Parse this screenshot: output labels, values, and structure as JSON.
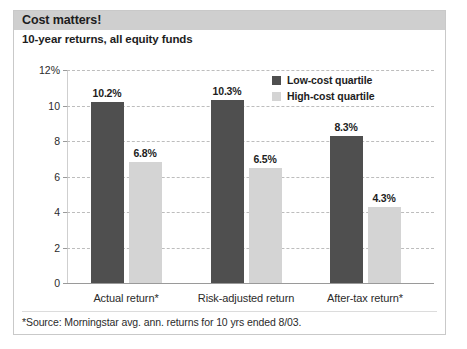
{
  "header": {
    "title": "Cost matters!",
    "subtitle": "10-year returns, all equity funds"
  },
  "footnote": "*Source: Morningstar avg. ann. returns for 10 yrs ended 8/03.",
  "legend": {
    "position": "top-right",
    "items": [
      {
        "label": "Low-cost quartile",
        "color": "#4f4f4f"
      },
      {
        "label": "High-cost quartile",
        "color": "#d4d4d4"
      }
    ]
  },
  "colors": {
    "low_cost": "#4f4f4f",
    "high_cost": "#d4d4d4",
    "header_band": "#cfcfcf",
    "gridline": "#bdbdbd",
    "frame": "#c9c9c9"
  },
  "chart_data": {
    "type": "bar",
    "title": "Cost matters!",
    "subtitle": "10-year returns, all equity funds",
    "xlabel": "",
    "ylabel": "",
    "ylim": [
      0,
      12
    ],
    "grid": true,
    "legend_position": "top-right",
    "categories": [
      "Actual return*",
      "Risk-adjusted return",
      "After-tax return*"
    ],
    "yticks": [
      0,
      2,
      4,
      6,
      8,
      10,
      12
    ],
    "ytick_labels": [
      "0",
      "2",
      "4",
      "6",
      "8",
      "10",
      "12%"
    ],
    "series": [
      {
        "name": "Low-cost quartile",
        "color": "#4f4f4f",
        "values": [
          10.2,
          10.3,
          8.3
        ],
        "data_labels": [
          "10.2%",
          "10.3%",
          "8.3%"
        ]
      },
      {
        "name": "High-cost quartile",
        "color": "#d4d4d4",
        "values": [
          6.8,
          6.5,
          4.3
        ],
        "data_labels": [
          "6.8%",
          "6.5%",
          "4.3%"
        ]
      }
    ],
    "annotations": [
      "*Source: Morningstar avg. ann. returns for 10 yrs ended 8/03."
    ]
  }
}
